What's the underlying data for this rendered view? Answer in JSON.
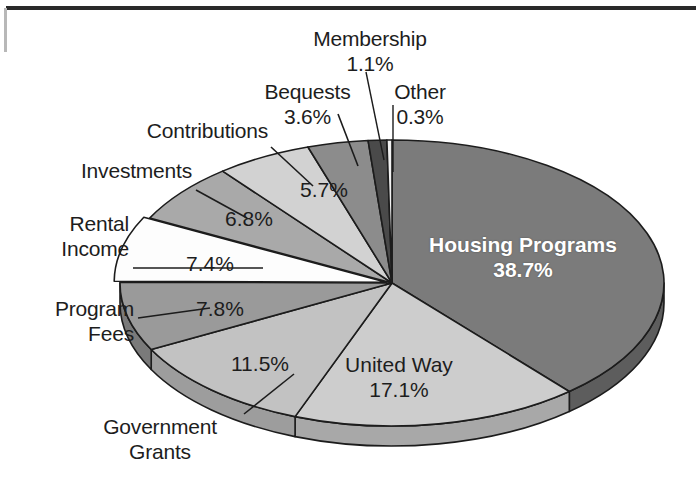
{
  "chart_data": {
    "type": "pie",
    "title": "",
    "subtitle": "",
    "xlabel": "",
    "ylabel": "",
    "legend_position": "callout-labels",
    "grid": false,
    "style": "3d-exploded-grayscale",
    "units": "percent",
    "total": 100.0,
    "categories": [
      "Housing Programs",
      "United Way",
      "Government Grants",
      "Program Fees",
      "Rental Income",
      "Investments",
      "Contributions",
      "Bequests",
      "Membership",
      "Other"
    ],
    "values": [
      38.7,
      17.1,
      11.5,
      7.8,
      7.4,
      6.8,
      5.7,
      3.6,
      1.1,
      0.3
    ],
    "value_labels": [
      "38.7%",
      "17.1%",
      "11.5%",
      "7.8%",
      "7.4%",
      "6.8%",
      "5.7%",
      "3.6%",
      "1.1%",
      "0.3%"
    ],
    "slice_colors": [
      "#7b7b7b",
      "#cdcdcd",
      "#c2c2c2",
      "#9a9a9a",
      "#fdfdfd",
      "#a9a9a9",
      "#d2d2d2",
      "#8c8c8c",
      "#4a4a4a",
      "#f2f2f2"
    ],
    "side_colors": [
      "#5d5d5d",
      "#a8a8a8",
      "#9d9d9d",
      "#7a7a7a",
      "#d4d4d4",
      "#868686",
      "#ababab",
      "#6c6c6c",
      "#343434",
      "#c9c9c9"
    ],
    "outline_color": "#1c1c1c",
    "background_color": "#ffffff",
    "label_color": "#1d1d1d",
    "highlight_label_color": "#ffffff"
  },
  "chart": {
    "slices": [
      {
        "name": "Housing Programs",
        "percent": "38.7%",
        "label_inside": true
      },
      {
        "name": "United Way",
        "percent": "17.1%",
        "label_inside": true
      },
      {
        "name": "Government Grants",
        "percent": "11.5%",
        "label_inside": false
      },
      {
        "name": "Program Fees",
        "percent": "7.8%",
        "label_inside": false
      },
      {
        "name": "Rental Income",
        "percent": "7.4%",
        "label_inside": false
      },
      {
        "name": "Investments",
        "percent": "6.8%",
        "label_inside": false
      },
      {
        "name": "Contributions",
        "percent": "5.7%",
        "label_inside": false
      },
      {
        "name": "Bequests",
        "percent": "3.6%",
        "label_inside": false
      },
      {
        "name": "Membership",
        "percent": "1.1%",
        "label_inside": false
      },
      {
        "name": "Other",
        "percent": "0.3%",
        "label_inside": false
      }
    ]
  },
  "labels": {
    "membership_name": "Membership",
    "membership_pct": "1.1%",
    "bequests_name": "Bequests",
    "bequests_pct": "3.6%",
    "other_name": "Other",
    "other_pct": "0.3%",
    "contributions_name": "Contributions",
    "contributions_pct": "5.7%",
    "investments_name": "Investments",
    "investments_pct": "6.8%",
    "rental_name_line1": "Rental",
    "rental_name_line2": "Income",
    "rental_pct": "7.4%",
    "program_name_line1": "Program",
    "program_name_line2": "Fees",
    "program_pct": "7.8%",
    "government_name_line1": "Government",
    "government_name_line2": "Grants",
    "government_pct": "11.5%",
    "unitedway_name": "United Way",
    "unitedway_pct": "17.1%",
    "housing_name": "Housing Programs",
    "housing_pct": "38.7%"
  }
}
